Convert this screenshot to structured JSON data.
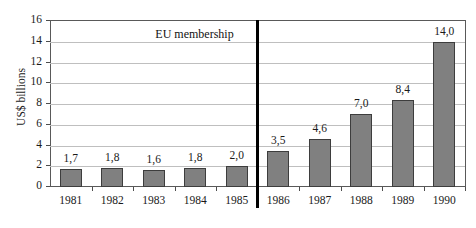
{
  "chart_data": {
    "type": "bar",
    "title": "",
    "subtitle": "",
    "xlabel": "",
    "ylabel": "US$ billions",
    "categories": [
      "1981",
      "1982",
      "1983",
      "1984",
      "1985",
      "1986",
      "1987",
      "1988",
      "1989",
      "1990"
    ],
    "values": [
      1.7,
      1.8,
      1.6,
      1.8,
      2.0,
      3.5,
      4.6,
      7.0,
      8.4,
      14.0
    ],
    "value_labels": [
      "1,7",
      "1,8",
      "1,6",
      "1,8",
      "2,0",
      "3,5",
      "4,6",
      "7,0",
      "8,4",
      "14,0"
    ],
    "ylim": [
      0,
      16
    ],
    "ytick_values": [
      0,
      2,
      4,
      6,
      8,
      10,
      12,
      14,
      16
    ],
    "ytick_labels": [
      "0",
      "2",
      "4",
      "6",
      "8",
      "10",
      "12",
      "14",
      "16"
    ],
    "grid": true,
    "grid_axis": "y",
    "legend": false,
    "legend_position": "none",
    "series": [
      {
        "name": "US$ billions",
        "values": [
          1.7,
          1.8,
          1.6,
          1.8,
          2.0,
          3.5,
          4.6,
          7.0,
          8.4,
          14.0
        ]
      }
    ],
    "annotations": [
      {
        "text": "EU membership",
        "type": "vertical-divider-label",
        "between_categories": [
          "1985",
          "1986"
        ]
      }
    ],
    "colors": {
      "bar_fill": "#808080",
      "bar_border": "#3d3d3d",
      "gridline": "#bfbfbf",
      "axis": "#595959",
      "divider": "#000000",
      "text": "#1a1a1a",
      "background": "#ffffff"
    }
  }
}
